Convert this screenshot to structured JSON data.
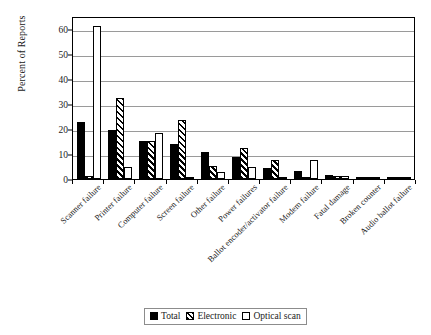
{
  "chart_data": {
    "type": "bar",
    "title": "",
    "xlabel": "",
    "ylabel": "Percent of Reports",
    "ylim": [
      0,
      65
    ],
    "yticks": [
      0,
      10,
      20,
      30,
      40,
      50,
      60
    ],
    "grid": true,
    "legend_position": "bottom-center",
    "categories": [
      "Scanner failure",
      "Printer failure",
      "Computer failure",
      "Screen failure",
      "Other failure",
      "Power failures",
      "Ballot encoder/activator failure",
      "Modem failure",
      "Fatal damage",
      "Broken counter",
      "Audio ballot failure"
    ],
    "series": [
      {
        "name": "Total",
        "fill": "solid-black",
        "values": [
          22.7,
          19.7,
          15.2,
          13.9,
          10.9,
          8.8,
          4.4,
          3.0,
          1.5,
          0.3,
          0.3
        ]
      },
      {
        "name": "Electronic",
        "fill": "diagonal-hatch",
        "values": [
          1.1,
          32.3,
          15.1,
          23.7,
          5.2,
          12.4,
          7.4,
          0.3,
          1.2,
          0.3,
          0.4
        ]
      },
      {
        "name": "Optical scan",
        "fill": "white-outline",
        "values": [
          61.2,
          4.7,
          18.4,
          0.6,
          2.7,
          4.6,
          0.8,
          7.5,
          1.1,
          0.2,
          0.5
        ]
      }
    ]
  },
  "legend": {
    "items": [
      {
        "label": "Total",
        "swatch": "solid-black-swatch"
      },
      {
        "label": "Electronic",
        "swatch": "hatched-swatch"
      },
      {
        "label": "Optical scan",
        "swatch": "white-outline-swatch"
      }
    ]
  }
}
